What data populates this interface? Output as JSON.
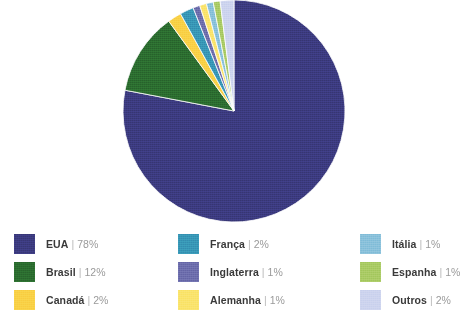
{
  "chart_data": {
    "type": "pie",
    "title": "",
    "subtitle": "",
    "xlabel": "",
    "ylabel": "",
    "grid": false,
    "legend_position": "bottom",
    "units": "%",
    "start_angle_deg": 0,
    "direction": "clockwise",
    "categories": [
      "EUA",
      "Brasil",
      "Canadá",
      "França",
      "Inglaterra",
      "Alemanha",
      "Itália",
      "Espanha",
      "Outros"
    ],
    "values": [
      78,
      12,
      2,
      2,
      1,
      1,
      1,
      1,
      2
    ],
    "value_labels": [
      "78%",
      "12%",
      "2%",
      "2%",
      "1%",
      "1%",
      "1%",
      "1%",
      "2%"
    ],
    "colors": [
      "#3b3a7d",
      "#2b6b2f",
      "#f9d045",
      "#3795b5",
      "#6b6cab",
      "#fae36a",
      "#87c0da",
      "#a8ca63",
      "#ccd3ee"
    ],
    "slices": [
      {
        "label": "EUA",
        "value": 78,
        "value_label": "78%",
        "color": "#3b3a7d"
      },
      {
        "label": "Brasil",
        "value": 12,
        "value_label": "12%",
        "color": "#2b6b2f"
      },
      {
        "label": "Canadá",
        "value": 2,
        "value_label": "2%",
        "color": "#f9d045"
      },
      {
        "label": "França",
        "value": 2,
        "value_label": "2%",
        "color": "#3795b5"
      },
      {
        "label": "Inglaterra",
        "value": 1,
        "value_label": "1%",
        "color": "#6b6cab"
      },
      {
        "label": "Alemanha",
        "value": 1,
        "value_label": "1%",
        "color": "#fae36a"
      },
      {
        "label": "Itália",
        "value": 1,
        "value_label": "1%",
        "color": "#87c0da"
      },
      {
        "label": "Espanha",
        "value": 1,
        "value_label": "1%",
        "color": "#a8ca63"
      },
      {
        "label": "Outros",
        "value": 2,
        "value_label": "2%",
        "color": "#ccd3ee"
      }
    ]
  },
  "legend": {
    "separator": "|",
    "columns": [
      {
        "items": [
          {
            "label": "EUA",
            "value_label": "78%",
            "color": "#3b3a7d"
          },
          {
            "label": "Brasil",
            "value_label": "12%",
            "color": "#2b6b2f"
          },
          {
            "label": "Canadá",
            "value_label": "2%",
            "color": "#f9d045"
          }
        ]
      },
      {
        "items": [
          {
            "label": "França",
            "value_label": "2%",
            "color": "#3795b5"
          },
          {
            "label": "Inglaterra",
            "value_label": "1%",
            "color": "#6b6cab"
          },
          {
            "label": "Alemanha",
            "value_label": "1%",
            "color": "#fae36a"
          }
        ]
      },
      {
        "items": [
          {
            "label": "Itália",
            "value_label": "1%",
            "color": "#87c0da"
          },
          {
            "label": "Espanha",
            "value_label": "1%",
            "color": "#a8ca63"
          },
          {
            "label": "Outros",
            "value_label": "2%",
            "color": "#ccd3ee"
          }
        ]
      }
    ]
  },
  "geometry": {
    "center_x": 234,
    "center_y": 111,
    "radius": 111
  }
}
